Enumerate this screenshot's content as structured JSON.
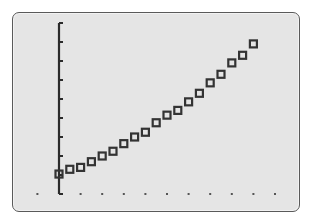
{
  "chart_data": {
    "type": "scatter",
    "title": "",
    "xlabel": "",
    "ylabel": "",
    "marker": "hollow-square",
    "grid": false,
    "legend": null,
    "x_tick_style": "dots",
    "y_tick_style": "marks",
    "xlim": [
      -1,
      10
    ],
    "ylim": [
      0,
      9
    ],
    "x_ticks": [
      -1,
      0,
      1,
      2,
      3,
      4,
      5,
      6,
      7,
      8,
      9,
      10
    ],
    "y_ticks": [
      0,
      1,
      2,
      3,
      4,
      5,
      6,
      7,
      8,
      9
    ],
    "x": [
      0,
      0.5,
      1,
      1.5,
      2,
      2.5,
      3,
      3.5,
      4,
      4.5,
      5,
      5.5,
      6,
      6.5,
      7,
      7.5,
      8,
      8.5,
      9
    ],
    "y": [
      1.05,
      1.3,
      1.4,
      1.7,
      2.0,
      2.25,
      2.65,
      3.0,
      3.25,
      3.75,
      4.15,
      4.4,
      4.85,
      5.3,
      5.85,
      6.3,
      6.9,
      7.3,
      7.9
    ]
  },
  "colors": {
    "screen_bg": "#e5e5e5",
    "frame": "#5a5a5a",
    "axis": "#2b2b2b",
    "marker": "#333333"
  }
}
